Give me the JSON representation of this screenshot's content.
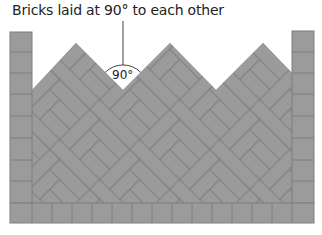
{
  "caption": "Bricks laid at 90° to each other",
  "angle_label": "90°",
  "colors": {
    "brick": "#9b9b9b",
    "joint": "#7e7e7e",
    "leader_line": "#444444",
    "background": "#ffffff"
  },
  "elements": {
    "edging_left": "Soldier-course edge bricks (left)",
    "edging_right": "Soldier-course edge bricks (right)",
    "edging_bottom": "Soldier-course edge bricks (bottom)",
    "field": "Herringbone field, zigzag top edge with three peaks"
  }
}
